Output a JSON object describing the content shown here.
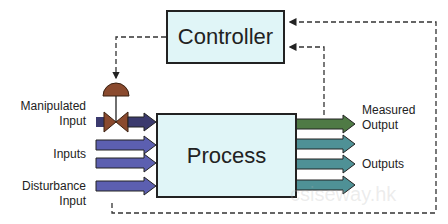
{
  "diagram": {
    "controller_label": "Controller",
    "process_label": "Process",
    "inputs": {
      "manipulated_label_1": "Manipulated",
      "manipulated_label_2": "Input",
      "inputs_label": "Inputs",
      "disturbance_label_1": "Disturbance",
      "disturbance_label_2": "Input"
    },
    "outputs": {
      "measured_label_1": "Measured",
      "measured_label_2": "Output",
      "outputs_label": "Outputs"
    },
    "watermark": "csiseway.hk",
    "colors": {
      "box_fill": "#e0f5f7",
      "input_arrow": "#5c5fb0",
      "manipulated_arrow": "#3b3a6e",
      "measured_arrow": "#4f7a45",
      "output_arrow": "#4f9196",
      "valve": "#8a4a2e"
    }
  }
}
